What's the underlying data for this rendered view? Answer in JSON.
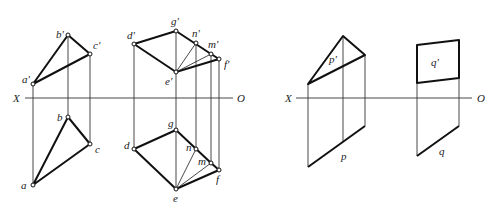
{
  "figure": {
    "axes": [
      {
        "left_label": "X",
        "right_label": "O"
      },
      {
        "left_label": "X",
        "right_label": "O"
      }
    ]
  },
  "diagram_left": {
    "triangle_abc": {
      "front_view": {
        "points": [
          "a'",
          "b'",
          "c'"
        ]
      },
      "top_view": {
        "points": [
          "a",
          "b",
          "c"
        ]
      }
    },
    "quad_defg": {
      "front_view": {
        "points": [
          "d'",
          "g'",
          "n'",
          "m'",
          "f'",
          "e'"
        ]
      },
      "top_view": {
        "points": [
          "d",
          "g",
          "n",
          "m",
          "f",
          "e"
        ]
      }
    }
  },
  "diagram_right": {
    "plane_p": {
      "front_label": "p'",
      "top_label": "p"
    },
    "plane_q": {
      "front_label": "q'",
      "top_label": "q"
    }
  },
  "labels": {
    "a_prime": "a'",
    "b_prime": "b'",
    "c_prime": "c'",
    "a": "a",
    "b": "b",
    "c": "c",
    "d_prime": "d'",
    "g_prime": "g'",
    "n_prime": "n'",
    "m_prime": "m'",
    "f_prime": "f'",
    "e_prime": "e'",
    "d": "d",
    "g": "g",
    "n": "n",
    "m": "m",
    "f": "f",
    "e": "e",
    "p_prime": "p'",
    "p": "p",
    "q_prime": "q'",
    "q": "q",
    "x1": "X",
    "o1": "O",
    "x2": "X",
    "o2": "O"
  }
}
